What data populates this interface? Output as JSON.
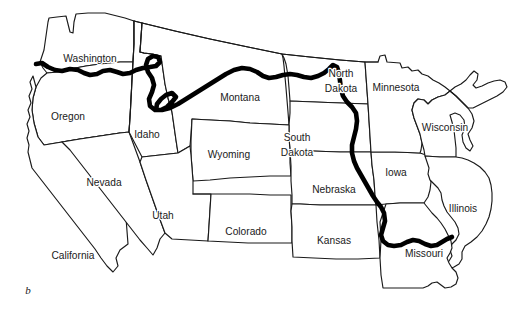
{
  "figure": {
    "panel_label": "b",
    "panel_label_x": 28,
    "panel_label_y": 291,
    "width": 508,
    "height": 321,
    "background_color": "#ffffff",
    "outline_color": "#1a1a1a",
    "highlight_color": "#000000"
  },
  "map": {
    "title": "",
    "type": "outline-map",
    "region": "Western and Midwestern United States",
    "labeled_state_count": 19,
    "states": [
      {
        "name": "Washington",
        "label": "Washington",
        "label_x": 90,
        "label_y": 59,
        "two_line": false
      },
      {
        "name": "Oregon",
        "label": "Oregon",
        "label_x": 68,
        "label_y": 117,
        "two_line": false
      },
      {
        "name": "Idaho",
        "label": "Idaho",
        "label_x": 147,
        "label_y": 135,
        "two_line": false
      },
      {
        "name": "Montana",
        "label": "Montana",
        "label_x": 240,
        "label_y": 98,
        "two_line": false
      },
      {
        "name": "North Dakota",
        "label": "North Dakota",
        "label_x": 341,
        "label_y": 81,
        "two_line": true,
        "line1": "North",
        "line2": "Dakota"
      },
      {
        "name": "Minnesota",
        "label": "Minnesota",
        "label_x": 396,
        "label_y": 88,
        "two_line": false
      },
      {
        "name": "Wisconsin",
        "label": "Wisconsin",
        "label_x": 445,
        "label_y": 128,
        "two_line": false
      },
      {
        "name": "South Dakota",
        "label": "South Dakota",
        "label_x": 297,
        "label_y": 145,
        "two_line": true,
        "line1": "South",
        "line2": "Dakota"
      },
      {
        "name": "Wyoming",
        "label": "Wyoming",
        "label_x": 229,
        "label_y": 155,
        "two_line": false
      },
      {
        "name": "Nevada",
        "label": "Nevada",
        "label_x": 104,
        "label_y": 183,
        "two_line": false
      },
      {
        "name": "Nebraska",
        "label": "Nebraska",
        "label_x": 334,
        "label_y": 190,
        "two_line": false
      },
      {
        "name": "Iowa",
        "label": "Iowa",
        "label_x": 396,
        "label_y": 173,
        "two_line": false
      },
      {
        "name": "Utah",
        "label": "Utah",
        "label_x": 163,
        "label_y": 216,
        "two_line": false
      },
      {
        "name": "Colorado",
        "label": "Colorado",
        "label_x": 246,
        "label_y": 232,
        "two_line": false
      },
      {
        "name": "Kansas",
        "label": "Kansas",
        "label_x": 334,
        "label_y": 241,
        "two_line": false
      },
      {
        "name": "Illinois",
        "label": "Illinois",
        "label_x": 463,
        "label_y": 209,
        "two_line": false
      },
      {
        "name": "Missouri",
        "label": "Missouri",
        "label_x": 424,
        "label_y": 254,
        "two_line": false
      },
      {
        "name": "California",
        "label": "California",
        "label_x": 73,
        "label_y": 256,
        "two_line": false
      },
      {
        "name": "Michigan",
        "label": "",
        "label_x": 0,
        "label_y": 0,
        "two_line": false
      }
    ],
    "highlighted_route": {
      "name": "route-line",
      "style": "thick solid black line",
      "stroke_width_px": 4.6,
      "passes_through": [
        "Washington",
        "Idaho",
        "Montana",
        "North Dakota",
        "South Dakota",
        "Nebraska",
        "Iowa",
        "Missouri"
      ],
      "start_description": "Pacific Northwest coast at the Washington-Oregon border",
      "end_description": "Mississippi River at the Missouri-Illinois border"
    }
  }
}
